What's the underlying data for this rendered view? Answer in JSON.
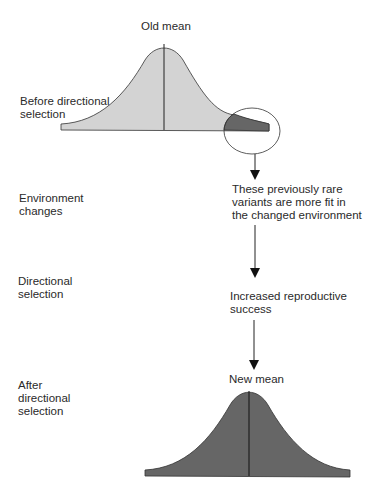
{
  "top_curve": {
    "mean_label": "Old mean",
    "stage_label": "Before directional\nselection",
    "fill_color": "#d3d3d3",
    "tail_color": "#666666"
  },
  "stages": {
    "environment": "Environment\nchanges",
    "directional": "Directional\nselection",
    "after": "After\ndirectional\nselection"
  },
  "flow": {
    "step1": "These previously rare\nvariants are more fit in\nthe changed environment",
    "step2": "Increased reproductive\nsuccess"
  },
  "bottom_curve": {
    "mean_label": "New mean",
    "fill_color": "#666666"
  }
}
